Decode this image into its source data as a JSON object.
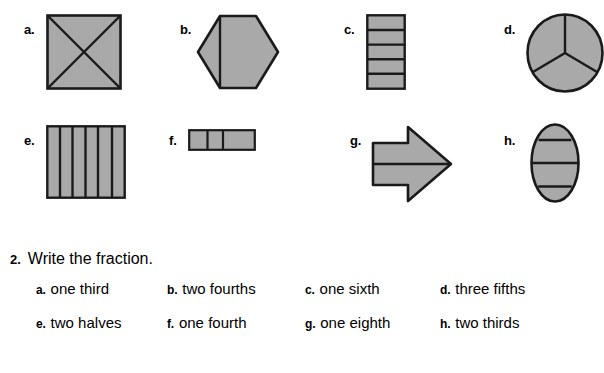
{
  "page": {
    "background_color": "#ffffff",
    "shape_fill_color": "#a9a9a9",
    "shape_stroke_color": "#1a1a1a"
  },
  "shapes": {
    "rows": [
      {
        "row_index": 0,
        "items": [
          {
            "label": "a.",
            "icon_name": "square-divided-into-four-triangles-shape",
            "figure": "square",
            "divisions": 4,
            "division_style": "both-diagonals",
            "shaded": true
          },
          {
            "label": "b.",
            "icon_name": "hexagon-divided-by-vertical-line-shape",
            "figure": "hexagon",
            "divisions": 2,
            "division_style": "one-vertical-line",
            "shaded": true
          },
          {
            "label": "c.",
            "icon_name": "vertical-rectangle-divided-into-five-rows-shape",
            "figure": "rectangle-vertical",
            "divisions": 5,
            "division_style": "horizontal-lines",
            "shaded": true
          },
          {
            "label": "d.",
            "icon_name": "circle-divided-into-three-sectors-shape",
            "figure": "circle",
            "divisions": 3,
            "division_style": "three-radii",
            "shaded": true
          }
        ]
      },
      {
        "row_index": 1,
        "items": [
          {
            "label": "e.",
            "icon_name": "square-divided-into-six-columns-shape",
            "figure": "square",
            "divisions": 6,
            "division_style": "vertical-lines",
            "shaded": true
          },
          {
            "label": "f.",
            "icon_name": "horizontal-bar-divided-into-three-parts-shape",
            "figure": "rectangle-horizontal",
            "divisions": 3,
            "division_style": "vertical-lines",
            "shaded": true
          },
          {
            "label": "g.",
            "icon_name": "right-arrow-divided-in-half-shape",
            "figure": "arrow-right",
            "divisions": 2,
            "division_style": "one-horizontal-line",
            "shaded": true
          },
          {
            "label": "h.",
            "icon_name": "ellipse-divided-into-four-bands-shape",
            "figure": "ellipse",
            "divisions": 4,
            "division_style": "horizontal-lines",
            "shaded": true
          }
        ]
      }
    ]
  },
  "question": {
    "number": "2.",
    "prompt": "Write the fraction."
  },
  "answers": {
    "rows": [
      {
        "row_index": 0,
        "items": [
          {
            "letter": "a.",
            "text": "one third"
          },
          {
            "letter": "b.",
            "text": "two fourths"
          },
          {
            "letter": "c.",
            "text": "one sixth"
          },
          {
            "letter": "d.",
            "text": "three fifths"
          }
        ]
      },
      {
        "row_index": 1,
        "items": [
          {
            "letter": "e.",
            "text": "two halves"
          },
          {
            "letter": "f.",
            "text": "one fourth"
          },
          {
            "letter": "g.",
            "text": "one eighth"
          },
          {
            "letter": "h.",
            "text": "two thirds"
          }
        ]
      }
    ]
  }
}
